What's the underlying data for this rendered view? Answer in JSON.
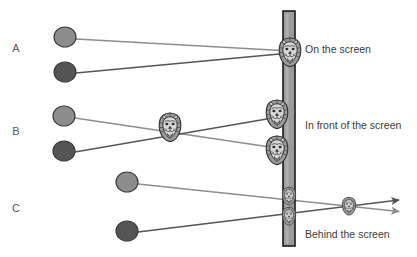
{
  "figure": {
    "background_color": "#ffffff",
    "width": 417,
    "height": 257
  },
  "palette": {
    "light_gray": "#8d8d8d",
    "dark_gray": "#555555",
    "circle_outline": "#3a3a3a",
    "screen_fill": "#9a9a9a",
    "screen_border": "#1a1a1a",
    "text_color": "#3b3b3b",
    "label_color": "#5a5a5a",
    "lion_mane": "#9b9b9b",
    "lion_face": "#d7d7d7",
    "lion_outline": "#2c2c2c"
  },
  "row_labels": [
    {
      "id": "A",
      "label": "A",
      "x": 16,
      "y": 52
    },
    {
      "id": "B",
      "label": "B",
      "x": 16,
      "y": 135
    },
    {
      "id": "C",
      "label": "C",
      "x": 16,
      "y": 212
    }
  ],
  "captions": [
    {
      "id": "on-screen",
      "text": "On the screen",
      "x": 305,
      "y": 53
    },
    {
      "id": "in-front",
      "text": "In front of the screen",
      "x": 305,
      "y": 129
    },
    {
      "id": "behind",
      "text": "Behind the screen",
      "x": 305,
      "y": 238
    }
  ],
  "screen": {
    "name": "projection-screen",
    "x": 283,
    "y": 11,
    "width": 12,
    "height": 235,
    "fill": "#9a9a9a",
    "stroke": "#1a1a1a"
  },
  "eyes": [
    {
      "id": "A-light",
      "row": "A",
      "eye": "left",
      "cx": 65,
      "cy": 37,
      "rx": 11,
      "ry": 10,
      "color": "#8d8d8d"
    },
    {
      "id": "A-dark",
      "row": "A",
      "eye": "right",
      "cx": 65,
      "cy": 72,
      "rx": 11,
      "ry": 10,
      "color": "#555555"
    },
    {
      "id": "B-light",
      "row": "B",
      "eye": "left",
      "cx": 64,
      "cy": 116,
      "rx": 11,
      "ry": 10,
      "color": "#8d8d8d"
    },
    {
      "id": "B-dark",
      "row": "B",
      "eye": "right",
      "cx": 64,
      "cy": 151,
      "rx": 11,
      "ry": 10,
      "color": "#555555"
    },
    {
      "id": "C-light",
      "row": "C",
      "eye": "left",
      "cx": 127,
      "cy": 182,
      "rx": 11,
      "ry": 10,
      "color": "#8d8d8d"
    },
    {
      "id": "C-dark",
      "row": "C",
      "eye": "right",
      "cx": 127,
      "cy": 231,
      "rx": 11,
      "ry": 10,
      "color": "#555555"
    }
  ],
  "sight_lines": [
    {
      "id": "A-light-ray",
      "row": "A",
      "color": "#8d8d8d",
      "x1": 76,
      "y1": 39,
      "x2": 290,
      "y2": 51,
      "arrow": false
    },
    {
      "id": "A-dark-ray",
      "row": "A",
      "color": "#555555",
      "x1": 76,
      "y1": 73,
      "x2": 290,
      "y2": 53,
      "arrow": false
    },
    {
      "id": "B-light-ray",
      "row": "B",
      "color": "#8d8d8d",
      "x1": 75,
      "y1": 118,
      "x2": 290,
      "y2": 150,
      "arrow": false
    },
    {
      "id": "B-dark-ray",
      "row": "B",
      "color": "#555555",
      "x1": 75,
      "y1": 152,
      "x2": 290,
      "y2": 115,
      "arrow": false
    },
    {
      "id": "C-light-ray",
      "row": "C",
      "color": "#8d8d8d",
      "x1": 138,
      "y1": 184,
      "x2": 404,
      "y2": 212,
      "arrow": true
    },
    {
      "id": "C-dark-ray",
      "row": "C",
      "color": "#555555",
      "x1": 138,
      "y1": 232,
      "x2": 404,
      "y2": 200,
      "arrow": true
    }
  ],
  "lions": [
    {
      "id": "A-fused",
      "row": "A",
      "cx": 290,
      "cy": 52,
      "scale": 1.0,
      "note": "fused image on the screen"
    },
    {
      "id": "B-screen-top",
      "row": "B",
      "cx": 277,
      "cy": 114,
      "scale": 1.0,
      "note": "left-eye image on screen"
    },
    {
      "id": "B-screen-bot",
      "row": "B",
      "cx": 277,
      "cy": 150,
      "scale": 1.0,
      "note": "right-eye image on screen"
    },
    {
      "id": "B-fused-front",
      "row": "B",
      "cx": 170,
      "cy": 127,
      "scale": 1.0,
      "note": "fused image in front of screen"
    },
    {
      "id": "C-screen-top",
      "row": "C",
      "cx": 289,
      "cy": 196,
      "scale": 0.62,
      "note": "left-eye image on screen"
    },
    {
      "id": "C-screen-bot",
      "row": "C",
      "cx": 289,
      "cy": 216,
      "scale": 0.62,
      "note": "right-eye image on screen"
    },
    {
      "id": "C-fused-behind",
      "row": "C",
      "cx": 349,
      "cy": 206,
      "scale": 0.62,
      "note": "fused image behind screen"
    }
  ]
}
